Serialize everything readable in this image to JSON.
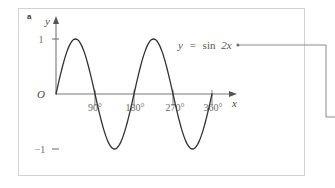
{
  "figure": {
    "part_label": "a",
    "annotation": {
      "equation_lhs": "y",
      "equation_eq": "=",
      "equation_fn": "sin",
      "equation_arg": "2x",
      "equation_full": "y = sin 2x"
    },
    "axes": {
      "x_axis_label": "x",
      "y_axis_label": "y",
      "origin_label": "O"
    },
    "colors": {
      "curve": "#333333",
      "axis": "#777777",
      "panel_border": "#d2d2d2",
      "leader_line": "#8a8a8a",
      "tick_text": "#6b6b6b",
      "background": "#ffffff"
    }
  },
  "chart_data": {
    "type": "line",
    "title": "",
    "subtitle": "",
    "xlabel": "x",
    "ylabel": "y",
    "equation": "y = sin 2x",
    "annotations": [
      "y = sin 2x"
    ],
    "grid": false,
    "legend": "none",
    "xlim": [
      0,
      400
    ],
    "ylim": [
      -1.35,
      1.35
    ],
    "xtick_labels": [
      "90°",
      "180°",
      "270°",
      "360°"
    ],
    "xticks": [
      90,
      180,
      270,
      360
    ],
    "ytick_labels": [
      "1",
      "−1"
    ],
    "yticks": [
      1,
      -1
    ],
    "series": [
      {
        "name": "y = sin 2x",
        "x": [
          0,
          5,
          10,
          15,
          20,
          25,
          30,
          35,
          40,
          45,
          50,
          55,
          60,
          65,
          70,
          75,
          80,
          85,
          90,
          95,
          100,
          105,
          110,
          115,
          120,
          125,
          130,
          135,
          140,
          145,
          150,
          155,
          160,
          165,
          170,
          175,
          180,
          185,
          190,
          195,
          200,
          205,
          210,
          215,
          220,
          225,
          230,
          235,
          240,
          245,
          250,
          255,
          260,
          265,
          270,
          275,
          280,
          285,
          290,
          295,
          300,
          305,
          310,
          315,
          320,
          325,
          330,
          335,
          340,
          345,
          350,
          355,
          360
        ],
        "y": [
          0,
          0.174,
          0.342,
          0.5,
          0.643,
          0.766,
          0.866,
          0.94,
          0.985,
          1,
          0.985,
          0.94,
          0.866,
          0.766,
          0.643,
          0.5,
          0.342,
          0.174,
          0,
          -0.174,
          -0.342,
          -0.5,
          -0.643,
          -0.766,
          -0.866,
          -0.94,
          -0.985,
          -1,
          -0.985,
          -0.94,
          -0.866,
          -0.766,
          -0.643,
          -0.5,
          -0.342,
          -0.174,
          0,
          0.174,
          0.342,
          0.5,
          0.643,
          0.766,
          0.866,
          0.94,
          0.985,
          1,
          0.985,
          0.94,
          0.866,
          0.766,
          0.643,
          0.5,
          0.342,
          0.174,
          0,
          -0.174,
          -0.342,
          -0.5,
          -0.643,
          -0.766,
          -0.866,
          -0.94,
          -0.985,
          -1,
          -0.985,
          -0.94,
          -0.866,
          -0.766,
          -0.643,
          -0.5,
          -0.342,
          -0.174,
          0
        ]
      }
    ],
    "maxima": [
      {
        "x": 45,
        "y": 1
      },
      {
        "x": 225,
        "y": 1
      }
    ],
    "minima": [
      {
        "x": 135,
        "y": -1
      },
      {
        "x": 315,
        "y": -1
      }
    ],
    "zeros": [
      0,
      90,
      180,
      270,
      360
    ],
    "period": 180,
    "amplitude": 1
  }
}
